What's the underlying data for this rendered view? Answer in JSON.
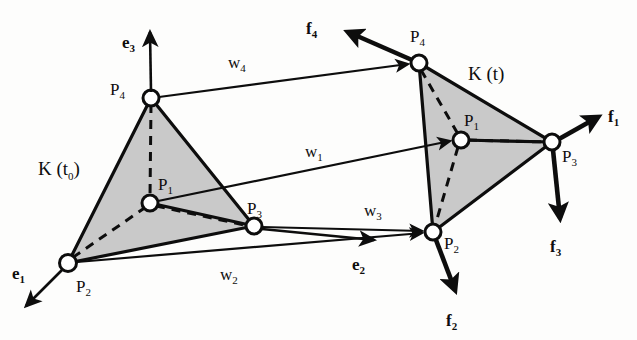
{
  "figure": {
    "title": "Tetrahedral element K in reference configuration K(t0) and deformed configuration K(t) with displacement vectors w and nodal forces f",
    "background_color": "#fdfdfc",
    "face_fill_color": "#c9c9c9",
    "line_color": "#0d0d0d",
    "node_fill_color": "#ffffff"
  },
  "regions": [
    {
      "id": "reference",
      "label_main": "K (t",
      "label_sub": "0",
      "label_close": ")",
      "x": 40,
      "y": 172
    },
    {
      "id": "current",
      "label_main": "K (t)",
      "label_sub": "",
      "label_close": "",
      "x": 470,
      "y": 80
    }
  ],
  "tetra_reference": {
    "name": "K(t0)",
    "vertices": [
      {
        "id": "P1",
        "label": "P",
        "sub": "1",
        "x": 150,
        "y": 203,
        "label_x": 158,
        "label_y": 190
      },
      {
        "id": "P2",
        "label": "P",
        "sub": "2",
        "x": 68,
        "y": 263,
        "label_x": 76,
        "label_y": 290
      },
      {
        "id": "P3",
        "label": "P",
        "sub": "3",
        "x": 254,
        "y": 226,
        "label_x": 247,
        "label_y": 214
      },
      {
        "id": "P4",
        "label": "P",
        "sub": "4",
        "x": 151,
        "y": 98,
        "label_x": 110,
        "label_y": 95
      }
    ],
    "visible_face": [
      "P4",
      "P3",
      "P2"
    ],
    "solid_edges": [
      [
        "P4",
        "P3"
      ],
      [
        "P3",
        "P2"
      ],
      [
        "P2",
        "P4"
      ],
      [
        "P4",
        "P1"
      ],
      [
        "P1",
        "P3"
      ]
    ],
    "hidden_edges": [
      [
        "P4",
        "P1"
      ],
      [
        "P1",
        "P2"
      ],
      [
        "P1",
        "P3"
      ]
    ]
  },
  "tetra_current": {
    "name": "K(t)",
    "vertices": [
      {
        "id": "P1",
        "label": "P",
        "sub": "1",
        "x": 461,
        "y": 140,
        "label_x": 464,
        "label_y": 126
      },
      {
        "id": "P2",
        "label": "P",
        "sub": "2",
        "x": 433,
        "y": 232,
        "label_x": 444,
        "label_y": 247
      },
      {
        "id": "P3",
        "label": "P",
        "sub": "3",
        "x": 552,
        "y": 142,
        "label_x": 562,
        "label_y": 160
      },
      {
        "id": "P4",
        "label": "P",
        "sub": "4",
        "x": 419,
        "y": 63,
        "label_x": 410,
        "label_y": 42
      }
    ],
    "visible_face": [
      "P4",
      "P3",
      "P2"
    ],
    "solid_edges": [
      [
        "P4",
        "P3"
      ],
      [
        "P3",
        "P2"
      ],
      [
        "P2",
        "P4"
      ],
      [
        "P4",
        "P1"
      ],
      [
        "P1",
        "P3"
      ]
    ],
    "hidden_edges": [
      [
        "P4",
        "P1"
      ],
      [
        "P1",
        "P2"
      ],
      [
        "P1",
        "P3"
      ]
    ]
  },
  "displacement_vectors": [
    {
      "id": "w4",
      "label": "w",
      "sub": "4",
      "from_x": 151,
      "from_y": 98,
      "to_x": 419,
      "to_y": 63,
      "label_x": 228,
      "label_y": 65
    },
    {
      "id": "w1",
      "label": "w",
      "sub": "1",
      "from_x": 150,
      "from_y": 203,
      "to_x": 461,
      "to_y": 140,
      "label_x": 305,
      "label_y": 155
    },
    {
      "id": "w3",
      "label": "w",
      "sub": "3",
      "from_x": 254,
      "from_y": 226,
      "to_x": 433,
      "to_y": 232,
      "label_x": 366,
      "label_y": 215
    },
    {
      "id": "w2",
      "label": "w",
      "sub": "2",
      "from_x": 68,
      "from_y": 263,
      "to_x": 433,
      "to_y": 232,
      "label_x": 222,
      "label_y": 276
    }
  ],
  "basis_vectors": [
    {
      "id": "e3",
      "label": "e",
      "sub": "3",
      "from_x": 151,
      "from_y": 98,
      "to_x": 150,
      "to_y": 28,
      "label_x": 124,
      "label_y": 45
    },
    {
      "id": "e1",
      "label": "e",
      "sub": "1",
      "from_x": 68,
      "from_y": 263,
      "to_x": 22,
      "to_y": 310,
      "label_x": 18,
      "label_y": 275
    },
    {
      "id": "e2",
      "label": "e",
      "sub": "2",
      "from_x": 254,
      "from_y": 226,
      "to_x": 382,
      "to_y": 241,
      "label_x": 356,
      "label_y": 267
    }
  ],
  "force_vectors": [
    {
      "id": "f4",
      "label": "f",
      "sub": "4",
      "from_x": 419,
      "from_y": 63,
      "to_x": 338,
      "to_y": 28,
      "label_x": 310,
      "label_y": 28
    },
    {
      "id": "f1",
      "label": "f",
      "sub": "1",
      "from_x": 552,
      "from_y": 142,
      "to_x": 608,
      "to_y": 112,
      "label_x": 613,
      "label_y": 118
    },
    {
      "id": "f3",
      "label": "f",
      "sub": "3",
      "from_x": 552,
      "from_y": 142,
      "to_x": 561,
      "to_y": 228,
      "label_x": 553,
      "label_y": 250
    },
    {
      "id": "f2",
      "label": "f",
      "sub": "2",
      "from_x": 433,
      "from_y": 232,
      "to_x": 458,
      "to_y": 300,
      "label_x": 449,
      "label_y": 322
    }
  ]
}
